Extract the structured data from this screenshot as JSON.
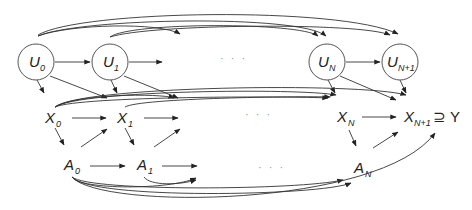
{
  "diagram": {
    "type": "directed-graph",
    "nodes": {
      "U0": {
        "base": "U",
        "sub": "0",
        "x": 36,
        "y": 62,
        "circled": true
      },
      "U1": {
        "base": "U",
        "sub": "1",
        "x": 110,
        "y": 62,
        "circled": true
      },
      "UN": {
        "base": "U",
        "sub": "N",
        "x": 327,
        "y": 62,
        "circled": true
      },
      "UN1": {
        "base": "U",
        "sub": "N+1",
        "x": 400,
        "y": 62,
        "circled": true
      },
      "X0": {
        "base": "X",
        "sub": "0",
        "x": 52,
        "y": 118
      },
      "X1": {
        "base": "X",
        "sub": "1",
        "x": 124,
        "y": 118
      },
      "XN": {
        "base": "X",
        "sub": "N",
        "x": 344,
        "y": 118
      },
      "XN1": {
        "base": "X",
        "sub": "N+1",
        "x": 410,
        "y": 118,
        "suffix": "⊇ Y"
      },
      "A0": {
        "base": "A",
        "sub": "0",
        "x": 70,
        "y": 168
      },
      "A1": {
        "base": "A",
        "sub": "1",
        "x": 143,
        "y": 168
      },
      "AN": {
        "base": "A",
        "sub": "N",
        "x": 360,
        "y": 168
      }
    },
    "ellipsis": [
      {
        "text": "· · ·",
        "x": 228,
        "y": 62
      },
      {
        "text": "· · ·",
        "x": 252,
        "y": 117
      },
      {
        "text": "· · ·",
        "x": 265,
        "y": 170
      }
    ],
    "edges": [
      "U0→U1",
      "U1→…",
      "UN→UN1",
      "U0→…",
      "U0→UN",
      "U0→UN1",
      "U1→UN",
      "U1→UN1",
      "U0→X0",
      "U0→X1",
      "U1→X1",
      "U1→…",
      "UN→XN",
      "UN→XN1",
      "UN1→XN1",
      "X0→X1",
      "X1→…",
      "XN→XN1",
      "X0→…",
      "X0→XN",
      "X0→XN1",
      "X1→XN",
      "X0→A0",
      "A0→X1",
      "X1→A1",
      "A1→…",
      "XN→AN",
      "AN→XN1",
      "A0→A1",
      "A1→…",
      "A0→…",
      "A0→AN",
      "A1→AN",
      "A0→XN1"
    ]
  }
}
